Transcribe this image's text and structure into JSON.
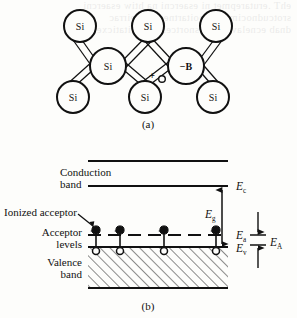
{
  "figure": {
    "panel_a": {
      "caption": "(a)",
      "atoms": [
        {
          "label": "Si",
          "cx": 80,
          "cy": 26,
          "r": 16
        },
        {
          "label": "Si",
          "cx": 148,
          "cy": 26,
          "r": 16
        },
        {
          "label": "Si",
          "cx": 216,
          "cy": 26,
          "r": 16
        },
        {
          "label": "Si",
          "cx": 108,
          "cy": 66,
          "r": 18
        },
        {
          "label": "−B",
          "cx": 186,
          "cy": 66,
          "r": 18
        },
        {
          "label": "Si",
          "cx": 73,
          "cy": 97,
          "r": 16
        },
        {
          "label": "Si",
          "cx": 145,
          "cy": 97,
          "r": 16
        },
        {
          "label": "Si",
          "cx": 213,
          "cy": 97,
          "r": 16
        }
      ],
      "bonds": [
        [
          80,
          26,
          108,
          66
        ],
        [
          148,
          26,
          108,
          66
        ],
        [
          148,
          26,
          186,
          66
        ],
        [
          216,
          26,
          186,
          66
        ],
        [
          108,
          66,
          73,
          97
        ],
        [
          108,
          66,
          145,
          97
        ],
        [
          186,
          66,
          145,
          97
        ],
        [
          186,
          66,
          213,
          97
        ]
      ],
      "hole_marker": {
        "label": "+",
        "circle": "o",
        "x": 155,
        "y": 76
      }
    },
    "panel_b": {
      "caption": "(b)",
      "labels": {
        "conduction_band_line1": "Conduction",
        "conduction_band_line2": "band",
        "ionized_acceptor": "Ionized acceptor",
        "acceptor_levels_line1": "Acceptor",
        "acceptor_levels_line2": "levels",
        "valence_band_line1": "Valence",
        "valence_band_line2": "band"
      },
      "energy_labels": [
        {
          "symbol": "E",
          "subscript": "c",
          "x": 238,
          "y": 189
        },
        {
          "symbol": "E",
          "subscript": "g",
          "x": 210,
          "y": 215
        },
        {
          "symbol": "E",
          "subscript": "a",
          "x": 238,
          "y": 237
        },
        {
          "symbol": "E",
          "subscript": "v",
          "x": 238,
          "y": 250
        },
        {
          "symbol": "E",
          "subscript": "A",
          "x": 274,
          "y": 243
        }
      ],
      "levels": {
        "conduction_top_y": 161,
        "Ec_y": 186,
        "Ea_y": 235,
        "Ev_y": 247,
        "valence_bottom_y": 288,
        "band_left_x": 88,
        "band_right_x": 228
      },
      "acceptor_sites_x": [
        96,
        120,
        164,
        216
      ],
      "acceptor_site_count": 4
    }
  },
  "colors": {
    "ink": "#111111",
    "paper": "#fdfdfb",
    "hatch": "#222222"
  },
  "background_bleed": {
    "line1": "ehT .erutarepmet ni esaercni na htiw esaercni",
    "line2": "srotcudnocimes ni noitartnecnoc reirrac",
    "line3": "dnab ecnelav eht ni snortcele fo noitaticxe"
  }
}
